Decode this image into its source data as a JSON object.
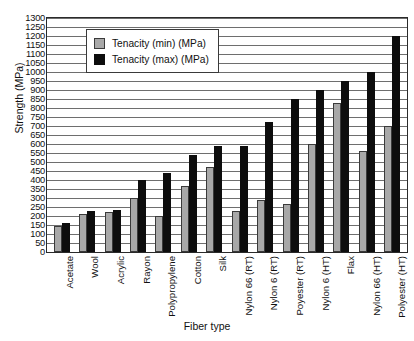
{
  "chart_data": {
    "type": "bar",
    "title": "",
    "xlabel": "Fiber type",
    "ylabel": "Strength (MPa)",
    "ylim": [
      0,
      1300
    ],
    "ytick_step": 50,
    "grid": true,
    "legend_position": "upper-left-inside",
    "categories": [
      "Acetate",
      "Wool",
      "Acrylic",
      "Rayon",
      "Polypropylene",
      "Cotton",
      "Silk",
      "Nylon 66 (RT)",
      "Nylon 6 (RT)",
      "Poyester (RT)",
      "Nylon 6 (HT)",
      "Flax",
      "Nylon 66 (HT)",
      "Polyester (HT)"
    ],
    "yticks": [
      "1300",
      "1250",
      "1200",
      "1150",
      "1100",
      "1050",
      "1000",
      "950",
      "900",
      "850",
      "800",
      "750",
      "700",
      "650",
      "600",
      "550",
      "500",
      "450",
      "400",
      "350",
      "300",
      "250",
      "200",
      "150",
      "100",
      "50",
      "0"
    ],
    "series": [
      {
        "name": "Tenacity (min) (MPa)",
        "color": "#a8a8a8",
        "values": [
          145,
          210,
          225,
          300,
          200,
          365,
          475,
          230,
          290,
          265,
          600,
          830,
          560,
          700
        ]
      },
      {
        "name": "Tenacity (max) (MPa)",
        "color": "#0d0d0d",
        "values": [
          160,
          230,
          235,
          400,
          440,
          540,
          590,
          590,
          720,
          850,
          900,
          950,
          1000,
          1200
        ]
      }
    ]
  }
}
